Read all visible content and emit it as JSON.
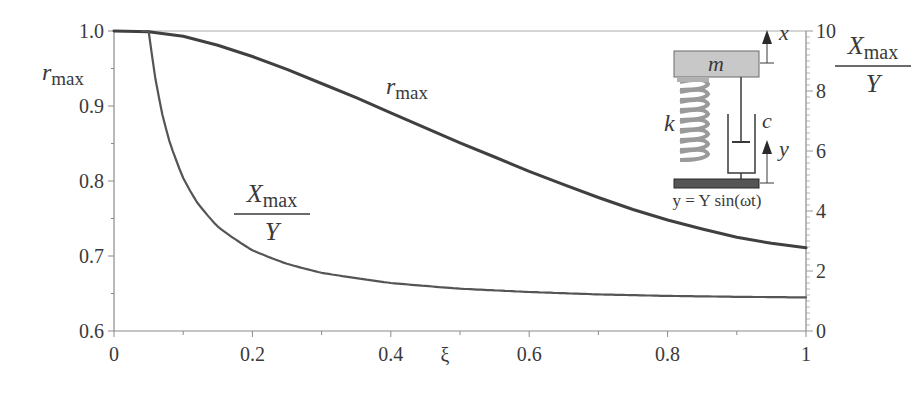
{
  "chart_data": {
    "type": "line",
    "title": "",
    "xlabel": "ξ",
    "ylabel_left": "r_max",
    "ylabel_right": "X_max / Y",
    "xlim": [
      0,
      1
    ],
    "ylim_left": [
      0.6,
      1.0
    ],
    "ylim_right": [
      0,
      10
    ],
    "grid": false,
    "x_ticks": [
      "0",
      "0.2",
      "0.4",
      "0.6",
      "0.8",
      "1"
    ],
    "y_left_ticks": [
      "0.6",
      "0.7",
      "0.8",
      "0.9",
      "1.0"
    ],
    "y_right_ticks": [
      "0",
      "2",
      "4",
      "6",
      "8",
      "10"
    ],
    "series": [
      {
        "name": "r_max",
        "axis": "left",
        "x": [
          0,
          0.05,
          0.1,
          0.15,
          0.2,
          0.25,
          0.3,
          0.35,
          0.4,
          0.45,
          0.5,
          0.55,
          0.6,
          0.65,
          0.7,
          0.75,
          0.8,
          0.85,
          0.9,
          0.95,
          1.0
        ],
        "values": [
          1.0,
          0.999,
          0.993,
          0.981,
          0.966,
          0.949,
          0.93,
          0.911,
          0.891,
          0.871,
          0.851,
          0.832,
          0.813,
          0.795,
          0.778,
          0.762,
          0.748,
          0.736,
          0.725,
          0.717,
          0.711
        ]
      },
      {
        "name": "X_max / Y",
        "axis": "right",
        "x": [
          0.04,
          0.05,
          0.06,
          0.07,
          0.08,
          0.1,
          0.12,
          0.15,
          0.2,
          0.25,
          0.3,
          0.4,
          0.5,
          0.6,
          0.7,
          0.8,
          0.9,
          1.0
        ],
        "values": [
          10.0,
          10.05,
          8.39,
          7.21,
          6.33,
          5.1,
          4.29,
          3.48,
          2.69,
          2.24,
          1.94,
          1.6,
          1.41,
          1.3,
          1.22,
          1.17,
          1.14,
          1.12
        ]
      }
    ],
    "annotations": {
      "r_max_label": {
        "main": "r",
        "sub": "max"
      },
      "ratio_label": {
        "num": "X",
        "num_sub": "max",
        "den": "Y"
      },
      "right_axis_label": {
        "num": "X",
        "num_sub": "max",
        "den": "Y"
      },
      "left_axis_label": {
        "main": "r",
        "sub": "max"
      }
    },
    "inset": {
      "mass_label": "m",
      "spring_label": "k",
      "damper_label": "c",
      "x_arrow_label": "x",
      "y_arrow_label": "y",
      "equation": "y = Y sin(ωt)"
    }
  }
}
